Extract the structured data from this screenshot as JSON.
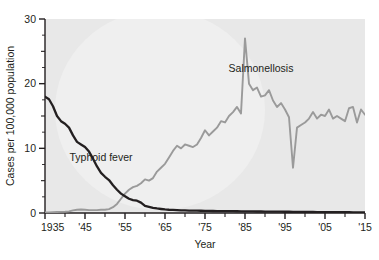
{
  "chart_data": {
    "type": "line",
    "title": "",
    "xlabel": "Year",
    "ylabel": "Cases per 100,000 population",
    "xlim": [
      1935,
      2015
    ],
    "ylim": [
      0,
      30
    ],
    "grid": false,
    "legend_position": "inline-annotations",
    "x_tick_labels": [
      "1935",
      "'45",
      "'55",
      "'65",
      "'75",
      "'85",
      "'95",
      "'05",
      "'15"
    ],
    "x_tick_values": [
      1935,
      1945,
      1955,
      1965,
      1975,
      1985,
      1995,
      2005,
      2015
    ],
    "x_minor_tick_values": [
      1940,
      1950,
      1960,
      1970,
      1980,
      1990,
      2000,
      2010
    ],
    "y_tick_labels": [
      "0",
      "10",
      "20",
      "30"
    ],
    "y_tick_values": [
      0,
      10,
      20,
      30
    ],
    "y_minor_tick_values": [
      5,
      15,
      25
    ],
    "colors": {
      "typhoid": "#231f20",
      "salmonellosis": "#9a9a9a",
      "panel": "#e8e8e8",
      "watermark": "#efefef",
      "axis": "#231f20",
      "page": "#ffffff"
    },
    "annotations": [
      {
        "text": "Typhoid fever",
        "x": 1949,
        "y": 8.0,
        "series": "typhoid"
      },
      {
        "text": "Salmonellosis",
        "x": 1989,
        "y": 21.8,
        "series": "salmonellosis"
      }
    ],
    "series": [
      {
        "name": "Typhoid fever",
        "color": "#231f20",
        "x": [
          1935,
          1936,
          1937,
          1938,
          1939,
          1940,
          1941,
          1942,
          1943,
          1944,
          1945,
          1946,
          1947,
          1948,
          1949,
          1950,
          1951,
          1952,
          1953,
          1954,
          1955,
          1956,
          1957,
          1958,
          1959,
          1960,
          1961,
          1962,
          1963,
          1964,
          1965,
          1966,
          1967,
          1968,
          1969,
          1970,
          1971,
          1972,
          1973,
          1974,
          1975,
          1976,
          1977,
          1978,
          1979,
          1980,
          1981,
          1982,
          1983,
          1984,
          1985,
          1986,
          1987,
          1988,
          1989,
          1990,
          1991,
          1992,
          1993,
          1994,
          1995,
          1996,
          1997,
          1998,
          1999,
          2000,
          2001,
          2002,
          2003,
          2004,
          2005,
          2006,
          2007,
          2008,
          2009,
          2010,
          2011,
          2012,
          2013,
          2014,
          2015
        ],
        "y": [
          18.0,
          17.6,
          16.5,
          15.0,
          14.2,
          13.8,
          13.2,
          12.0,
          11.0,
          10.6,
          10.2,
          9.5,
          8.4,
          7.2,
          6.2,
          5.6,
          5.1,
          4.3,
          3.6,
          3.0,
          2.6,
          2.2,
          2.0,
          1.9,
          1.6,
          1.1,
          0.95,
          0.8,
          0.7,
          0.62,
          0.55,
          0.5,
          0.47,
          0.45,
          0.42,
          0.4,
          0.38,
          0.37,
          0.36,
          0.35,
          0.33,
          0.32,
          0.31,
          0.3,
          0.3,
          0.29,
          0.28,
          0.28,
          0.27,
          0.26,
          0.25,
          0.25,
          0.24,
          0.23,
          0.23,
          0.22,
          0.22,
          0.21,
          0.2,
          0.2,
          0.19,
          0.19,
          0.18,
          0.18,
          0.17,
          0.17,
          0.16,
          0.16,
          0.15,
          0.15,
          0.14,
          0.14,
          0.13,
          0.13,
          0.12,
          0.12,
          0.12,
          0.11,
          0.11,
          0.1,
          0.1
        ]
      },
      {
        "name": "Salmonellosis",
        "color": "#9a9a9a",
        "x": [
          1935,
          1936,
          1937,
          1938,
          1939,
          1940,
          1941,
          1942,
          1943,
          1944,
          1945,
          1946,
          1947,
          1948,
          1949,
          1950,
          1951,
          1952,
          1953,
          1954,
          1955,
          1956,
          1957,
          1958,
          1959,
          1960,
          1961,
          1962,
          1963,
          1964,
          1965,
          1966,
          1967,
          1968,
          1969,
          1970,
          1971,
          1972,
          1973,
          1974,
          1975,
          1976,
          1977,
          1978,
          1979,
          1980,
          1981,
          1982,
          1983,
          1984,
          1985,
          1986,
          1987,
          1988,
          1989,
          1990,
          1991,
          1992,
          1993,
          1994,
          1995,
          1996,
          1997,
          1998,
          1999,
          2000,
          2001,
          2002,
          2003,
          2004,
          2005,
          2006,
          2007,
          2008,
          2009,
          2010,
          2011,
          2012,
          2013,
          2014,
          2015
        ],
        "y": [
          0.1,
          0.1,
          0.12,
          0.15,
          0.18,
          0.2,
          0.25,
          0.4,
          0.5,
          0.55,
          0.5,
          0.45,
          0.45,
          0.45,
          0.5,
          0.5,
          0.6,
          0.9,
          1.4,
          2.2,
          3.0,
          3.6,
          4.0,
          4.2,
          4.6,
          5.2,
          5.0,
          5.4,
          6.4,
          7.0,
          7.6,
          8.6,
          9.6,
          10.4,
          10.0,
          10.6,
          10.4,
          10.2,
          10.6,
          11.6,
          12.8,
          12.0,
          12.6,
          13.2,
          14.2,
          14.0,
          15.0,
          15.6,
          16.4,
          15.4,
          27.0,
          20.0,
          19.0,
          19.4,
          18.0,
          18.2,
          19.0,
          17.4,
          16.4,
          17.0,
          16.0,
          14.8,
          7.0,
          13.2,
          13.6,
          14.0,
          14.6,
          15.6,
          14.6,
          15.2,
          15.0,
          16.0,
          14.6,
          15.0,
          14.6,
          14.2,
          16.2,
          16.4,
          14.0,
          16.0,
          15.2
        ]
      }
    ]
  }
}
